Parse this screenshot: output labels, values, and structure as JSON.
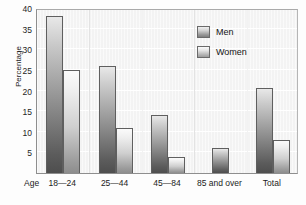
{
  "chart_data": {
    "type": "bar",
    "title": "",
    "subtitle": "",
    "xlabel": "Age",
    "ylabel": "Percentage",
    "categories": [
      "18—24",
      "25—44",
      "45—84",
      "85 and over",
      "Total"
    ],
    "series": [
      {
        "name": "Men",
        "values": [
          38,
          26,
          14,
          6,
          20.5
        ]
      },
      {
        "name": "Women",
        "values": [
          25,
          11,
          4,
          null,
          8
        ]
      }
    ],
    "ylim": [
      0,
      40
    ],
    "yticks": [
      5,
      10,
      15,
      20,
      25,
      30,
      35,
      40
    ],
    "ytick_labels": [
      "5",
      "10",
      "15",
      "20",
      "25",
      "30",
      "35",
      "40"
    ],
    "grid": "horizontal",
    "legend_position": "inside-top-right",
    "bar_colors": {
      "Men": "#7a7a7a",
      "Women": "#c4c4c4"
    },
    "plot_background": "#f3f3f3",
    "frame_color": "#8e8e8e"
  },
  "legend": {
    "entries": [
      {
        "label": "Men"
      },
      {
        "label": "Women"
      }
    ]
  },
  "axes": {
    "x_caption": "Age",
    "y_title": "Percentage"
  }
}
